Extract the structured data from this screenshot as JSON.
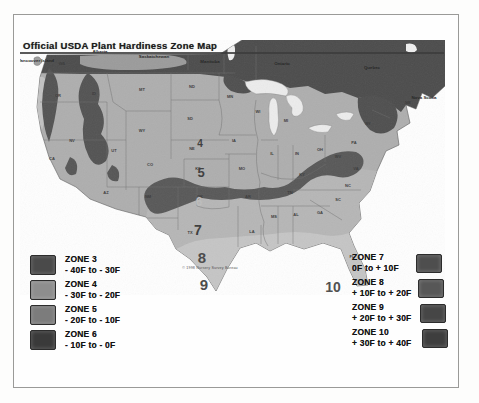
{
  "page": {
    "title": "Official USDA Plant Hardiness Zone Map"
  },
  "map": {
    "caption": {
      "t": "© 1998 Nursery Survey Bureau",
      "x": 190,
      "y": 229
    },
    "provinces": [
      {
        "t": "Vancouver Island",
        "x": 16,
        "y": 22
      },
      {
        "t": "Alberta",
        "x": 80,
        "y": 13
      },
      {
        "t": "Saskatchewan",
        "x": 134,
        "y": 18
      },
      {
        "t": "Manitoba",
        "x": 190,
        "y": 23
      },
      {
        "t": "Ontario",
        "x": 262,
        "y": 25
      },
      {
        "t": "Quebec",
        "x": 352,
        "y": 29
      },
      {
        "t": "Nova Scotia",
        "x": 404,
        "y": 59
      }
    ],
    "states": [
      {
        "t": "WA",
        "x": 42,
        "y": 25
      },
      {
        "t": "OR",
        "x": 38,
        "y": 57
      },
      {
        "t": "ID",
        "x": 74,
        "y": 55
      },
      {
        "t": "MT",
        "x": 122,
        "y": 51
      },
      {
        "t": "ND",
        "x": 172,
        "y": 48
      },
      {
        "t": "MN",
        "x": 210,
        "y": 58
      },
      {
        "t": "WI",
        "x": 238,
        "y": 73
      },
      {
        "t": "MI",
        "x": 266,
        "y": 82
      },
      {
        "t": "NY",
        "x": 348,
        "y": 85
      },
      {
        "t": "ME",
        "x": 388,
        "y": 64
      },
      {
        "t": "PA",
        "x": 334,
        "y": 104
      },
      {
        "t": "OH",
        "x": 300,
        "y": 111
      },
      {
        "t": "IN",
        "x": 277,
        "y": 115
      },
      {
        "t": "IL",
        "x": 252,
        "y": 115
      },
      {
        "t": "IA",
        "x": 214,
        "y": 102
      },
      {
        "t": "NE",
        "x": 172,
        "y": 110
      },
      {
        "t": "SD",
        "x": 170,
        "y": 80
      },
      {
        "t": "WY",
        "x": 122,
        "y": 92
      },
      {
        "t": "NV",
        "x": 52,
        "y": 102
      },
      {
        "t": "UT",
        "x": 94,
        "y": 112
      },
      {
        "t": "CA",
        "x": 32,
        "y": 120
      },
      {
        "t": "AZ",
        "x": 86,
        "y": 154
      },
      {
        "t": "NM",
        "x": 128,
        "y": 158
      },
      {
        "t": "CO",
        "x": 130,
        "y": 126
      },
      {
        "t": "KS",
        "x": 178,
        "y": 130
      },
      {
        "t": "MO",
        "x": 222,
        "y": 130
      },
      {
        "t": "OK",
        "x": 180,
        "y": 158
      },
      {
        "t": "AR",
        "x": 228,
        "y": 158
      },
      {
        "t": "KY",
        "x": 282,
        "y": 136
      },
      {
        "t": "TN",
        "x": 270,
        "y": 154
      },
      {
        "t": "WV",
        "x": 318,
        "y": 118
      },
      {
        "t": "VA",
        "x": 336,
        "y": 130
      },
      {
        "t": "NC",
        "x": 328,
        "y": 147
      },
      {
        "t": "SC",
        "x": 318,
        "y": 161
      },
      {
        "t": "GA",
        "x": 300,
        "y": 174
      },
      {
        "t": "AL",
        "x": 276,
        "y": 176
      },
      {
        "t": "MS",
        "x": 254,
        "y": 178
      },
      {
        "t": "LA",
        "x": 232,
        "y": 193
      },
      {
        "t": "TX",
        "x": 170,
        "y": 194
      },
      {
        "t": "FL",
        "x": 332,
        "y": 218
      }
    ],
    "zone_numbers": [
      {
        "t": "4",
        "x": 180,
        "y": 107,
        "s": 10,
        "c": "#3d3d3d"
      },
      {
        "t": "5",
        "x": 181,
        "y": 137,
        "s": 13,
        "c": "#3d3d3d"
      },
      {
        "t": "6",
        "x": 179,
        "y": 166,
        "s": 12,
        "c": "#bdbdbd"
      },
      {
        "t": "7",
        "x": 178,
        "y": 195,
        "s": 14,
        "c": "#3d3d3d"
      },
      {
        "t": "8",
        "x": 182,
        "y": 223,
        "s": 15,
        "c": "#494949"
      },
      {
        "t": "9",
        "x": 184,
        "y": 250,
        "s": 15,
        "c": "#494949"
      },
      {
        "t": "10",
        "x": 313,
        "y": 252,
        "s": 14,
        "c": "#4e4e4e"
      }
    ]
  },
  "legend_left": [
    {
      "zone": "ZONE 3",
      "range": "- 40F to - 30F",
      "color": "#4a4a4a"
    },
    {
      "zone": "ZONE 4",
      "range": "- 30F to - 20F",
      "color": "#8e8e8e"
    },
    {
      "zone": "ZONE 5",
      "range": "- 20F to - 10F",
      "color": "#7c7c7c"
    },
    {
      "zone": "ZONE 6",
      "range": "- 10F to - 0F",
      "color": "#3a3a3a"
    }
  ],
  "legend_right": [
    {
      "zone": "ZONE 7",
      "range": "0F to + 10F",
      "color": "#4e4e4e"
    },
    {
      "zone": "ZONE 8",
      "range": "+ 10F to + 20F",
      "color": "#575757"
    },
    {
      "zone": "ZONE 9",
      "range": "+ 20F to + 30F",
      "color": "#464646"
    },
    {
      "zone": "ZONE 10",
      "range": "+ 30F to + 40F",
      "color": "#3e3e3e"
    }
  ]
}
